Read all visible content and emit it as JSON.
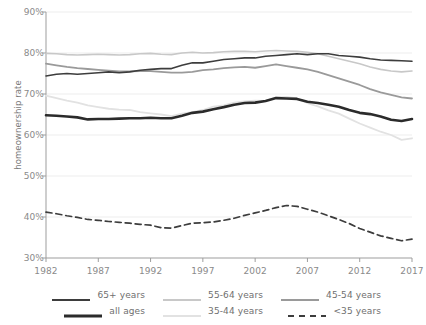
{
  "axes": {
    "y_title": "homeownership rate",
    "y_ticks": [
      "30%",
      "40%",
      "50%",
      "60%",
      "70%",
      "80%",
      "90%"
    ],
    "x_ticks": [
      "1982",
      "1987",
      "1992",
      "1997",
      "2002",
      "2007",
      "2012",
      "2017"
    ]
  },
  "legend": {
    "row1": [
      {
        "label": "65+ years",
        "key": "age65plus"
      },
      {
        "label": "55-64 years",
        "key": "age5564"
      },
      {
        "label": "45-54 years",
        "key": "age4554"
      }
    ],
    "row2": [
      {
        "label": "all ages",
        "key": "allages"
      },
      {
        "label": "35-44 years",
        "key": "age3544"
      },
      {
        "label": "<35 years",
        "key": "under35"
      }
    ]
  },
  "chart_data": {
    "type": "line",
    "title": "",
    "xlabel": "",
    "ylabel": "homeownership rate",
    "xlim": [
      1982,
      2017
    ],
    "ylim": [
      30,
      90
    ],
    "ytick_values": [
      30,
      40,
      50,
      60,
      70,
      80,
      90
    ],
    "xtick_values": [
      1982,
      1987,
      1992,
      1997,
      2002,
      2007,
      2012,
      2017
    ],
    "grid": true,
    "legend_position": "bottom",
    "x": [
      1982,
      1983,
      1984,
      1985,
      1986,
      1987,
      1988,
      1989,
      1990,
      1991,
      1992,
      1993,
      1994,
      1995,
      1996,
      1997,
      1998,
      1999,
      2000,
      2001,
      2002,
      2003,
      2004,
      2005,
      2006,
      2007,
      2008,
      2009,
      2010,
      2011,
      2012,
      2013,
      2014,
      2015,
      2016,
      2017
    ],
    "series": [
      {
        "name": "65+ years",
        "color": "#3d3d3d",
        "width": 1.6,
        "dash": "none",
        "values": [
          74.4,
          74.8,
          75.0,
          74.8,
          75.0,
          75.2,
          75.4,
          75.2,
          75.4,
          75.8,
          76.0,
          76.2,
          76.2,
          77.0,
          77.6,
          77.6,
          78.0,
          78.4,
          78.6,
          78.8,
          78.8,
          79.2,
          79.4,
          79.6,
          79.8,
          79.6,
          79.8,
          79.8,
          79.4,
          79.2,
          79.0,
          78.6,
          78.3,
          78.2,
          78.1,
          78.0
        ]
      },
      {
        "name": "55-64 years",
        "color": "#c8c8c8",
        "width": 1.6,
        "dash": "none",
        "values": [
          79.9,
          79.8,
          79.6,
          79.5,
          79.6,
          79.7,
          79.6,
          79.5,
          79.6,
          79.8,
          79.9,
          79.7,
          79.6,
          80.0,
          80.2,
          80.0,
          80.1,
          80.3,
          80.4,
          80.4,
          80.3,
          80.5,
          80.6,
          80.5,
          80.4,
          80.2,
          79.8,
          79.2,
          78.6,
          78.0,
          77.4,
          76.6,
          76.0,
          75.6,
          75.4,
          75.6
        ]
      },
      {
        "name": "45-54 years",
        "color": "#9a9a9a",
        "width": 1.8,
        "dash": "none",
        "values": [
          77.4,
          77.0,
          76.6,
          76.3,
          76.1,
          75.9,
          75.7,
          75.5,
          75.5,
          75.6,
          75.6,
          75.4,
          75.2,
          75.2,
          75.4,
          75.8,
          76.0,
          76.3,
          76.5,
          76.6,
          76.4,
          76.8,
          77.2,
          76.8,
          76.4,
          76.0,
          75.4,
          74.6,
          73.8,
          73.0,
          72.2,
          71.2,
          70.4,
          69.8,
          69.2,
          68.9
        ]
      },
      {
        "name": "all ages",
        "color": "#2b2b2b",
        "width": 2.6,
        "dash": "none",
        "values": [
          64.8,
          64.7,
          64.5,
          64.3,
          63.8,
          63.9,
          63.9,
          64.0,
          64.1,
          64.1,
          64.2,
          64.1,
          64.1,
          64.7,
          65.4,
          65.7,
          66.3,
          66.8,
          67.4,
          67.8,
          67.9,
          68.3,
          69.0,
          68.9,
          68.8,
          68.1,
          67.8,
          67.4,
          66.9,
          66.1,
          65.4,
          65.1,
          64.5,
          63.7,
          63.4,
          63.9
        ]
      },
      {
        "name": "35-44 years",
        "color": "#e2e2e2",
        "width": 1.8,
        "dash": "none",
        "values": [
          69.6,
          69.0,
          68.4,
          67.9,
          67.2,
          66.8,
          66.4,
          66.2,
          66.1,
          65.6,
          65.3,
          65.0,
          64.6,
          65.2,
          65.6,
          66.1,
          66.9,
          67.2,
          67.9,
          68.2,
          68.4,
          68.3,
          69.2,
          69.3,
          68.9,
          67.8,
          67.0,
          66.0,
          65.2,
          64.0,
          62.8,
          61.8,
          60.8,
          60.0,
          58.8,
          59.2
        ]
      },
      {
        "name": "<35 years",
        "color": "#3d3d3d",
        "width": 1.7,
        "dash": "6,4",
        "values": [
          41.2,
          40.8,
          40.3,
          39.9,
          39.4,
          39.2,
          38.9,
          38.7,
          38.5,
          38.2,
          38.0,
          37.4,
          37.3,
          37.9,
          38.5,
          38.6,
          38.8,
          39.2,
          39.7,
          40.4,
          41.0,
          41.6,
          42.3,
          42.8,
          42.6,
          41.9,
          41.2,
          40.3,
          39.4,
          38.4,
          37.2,
          36.3,
          35.4,
          34.8,
          34.2,
          34.6
        ]
      }
    ]
  }
}
